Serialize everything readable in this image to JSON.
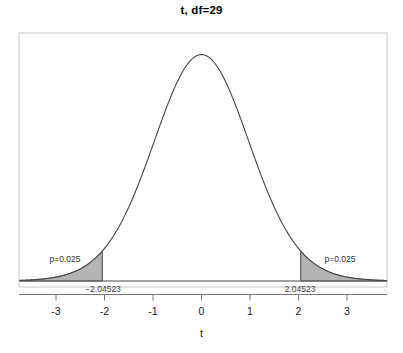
{
  "chart_data": {
    "type": "line",
    "title": "t, df=29",
    "xlabel": "t",
    "ylabel": "",
    "distribution": "student-t",
    "df": 29,
    "xlim": [
      -3.75,
      3.82
    ],
    "ylim": [
      0,
      0.4175
    ],
    "grid": false,
    "legend": null,
    "x_ticks": [
      -3,
      -2,
      -1,
      0,
      1,
      2,
      3
    ],
    "x_tick_labels": [
      "-3",
      "-2",
      "-1",
      "0",
      "1",
      "2",
      "3"
    ],
    "curve_description": "Student's t probability density with 29 degrees of freedom, peak density 0.3956 at t=0",
    "x": [
      -3.75,
      -3.5,
      -3.25,
      -3,
      -2.75,
      -2.5,
      -2.25,
      -2.04523,
      -1.75,
      -1.5,
      -1.25,
      -1,
      -0.75,
      -0.5,
      -0.25,
      0,
      0.25,
      0.5,
      0.75,
      1,
      1.25,
      1.5,
      1.75,
      2.04523,
      2.25,
      2.5,
      2.75,
      3,
      3.25,
      3.5,
      3.75
    ],
    "y": [
      0.00133,
      0.00243,
      0.00434,
      0.00759,
      0.01297,
      0.02163,
      0.03513,
      0.04984,
      0.08549,
      0.12762,
      0.18165,
      0.24,
      0.29861,
      0.34785,
      0.38212,
      0.39564,
      0.38212,
      0.34785,
      0.29861,
      0.24,
      0.18165,
      0.12762,
      0.08549,
      0.04984,
      0.03513,
      0.02163,
      0.01297,
      0.00759,
      0.00434,
      0.00243,
      0.00133
    ],
    "shaded_regions": [
      {
        "name": "left-tail",
        "from": -3.82,
        "to": -2.04523,
        "area": 0.025,
        "label": "p=0.025",
        "boundary_label": "−2.04523",
        "fill": "#b4b4b4"
      },
      {
        "name": "right-tail",
        "from": 2.04523,
        "to": 3.82,
        "area": 0.025,
        "label": "p=0.025",
        "boundary_label": "2.04523",
        "fill": "#b4b4b4"
      }
    ],
    "critical_values": [
      -2.04523,
      2.04523
    ],
    "annotations": [
      {
        "text": "p=0.025",
        "x": -2.85,
        "y": 0.088
      },
      {
        "text": "p=0.025",
        "x": 2.85,
        "y": 0.088
      },
      {
        "text": "−2.04523",
        "x": -2.04523,
        "y": 0.0
      },
      {
        "text": "2.04523",
        "x": 2.04523,
        "y": 0.0
      }
    ],
    "colors": {
      "curve": "#444444",
      "shade_fill": "#b4b4b4",
      "shade_edge": "#6e6e6e",
      "axis": "#666666",
      "box": "#c8c8c8",
      "text": "#1a1a1a"
    }
  },
  "labels": {
    "tick_neg3": "-3",
    "tick_neg2": "-2",
    "tick_neg1": "-1",
    "tick_0": "0",
    "tick_1": "1",
    "tick_2": "2",
    "tick_3": "3",
    "crit_left": "−2.04523",
    "crit_right": "2.04523",
    "p_left": "p=0.025",
    "p_right": "p=0.025",
    "xaxis_title": "t",
    "main_title": "t, df=29"
  }
}
